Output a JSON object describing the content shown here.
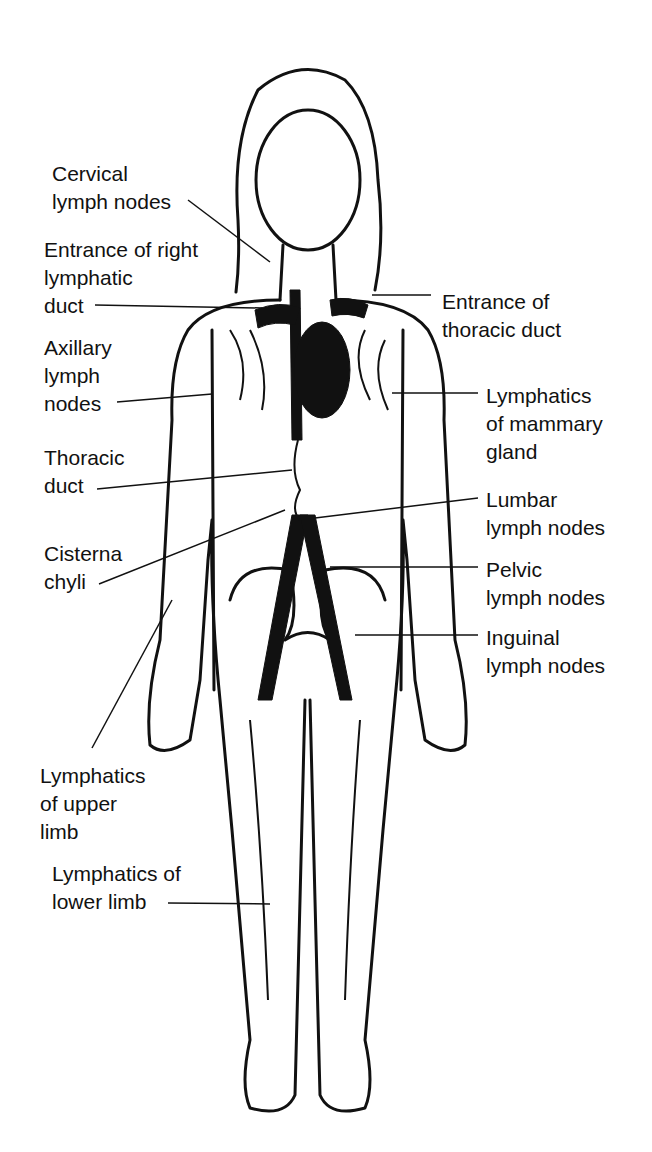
{
  "diagram": {
    "labels": {
      "cervical": "Cervical\nlymph nodes",
      "right_duct": "Entrance of right\nlymphatic\nduct",
      "axillary": "Axillary\nlymph\nnodes",
      "thoracic_duct": "Thoracic\nduct",
      "cisterna": "Cisterna\nchyli",
      "upper_limb": "Lymphatics\nof upper\nlimb",
      "lower_limb": "Lymphatics of\nlower limb",
      "thoracic_entrance": "Entrance of\nthoracic duct",
      "mammary": "Lymphatics\nof mammary\ngland",
      "lumbar": "Lumbar\nlymph nodes",
      "pelvic": "Pelvic\nlymph nodes",
      "inguinal": "Inguinal\nlymph nodes"
    }
  }
}
